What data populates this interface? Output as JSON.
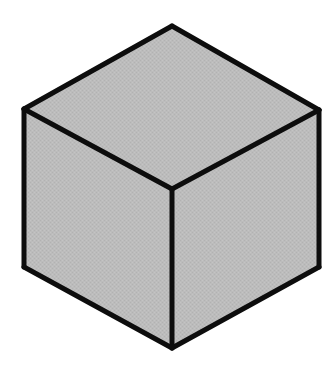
{
  "figure": {
    "name": "isometric-cube",
    "canvas": {
      "width": 336,
      "height": 365,
      "background_color": "#ffffff"
    },
    "style": {
      "edge_color": "#0d0d0d",
      "edge_width": 5,
      "face_fill": "#b9b9b9",
      "face_fill_alt": "#bdbdbd",
      "texture": "fine dithered halftone grain"
    },
    "vertices": {
      "top": [
        172,
        26
      ],
      "upper_left": [
        24,
        109
      ],
      "upper_right": [
        319,
        110
      ],
      "center": [
        172,
        189
      ],
      "lower_left": [
        24,
        267
      ],
      "lower_right": [
        319,
        267
      ],
      "bottom": [
        172,
        348
      ]
    },
    "faces": [
      {
        "id": "top-face",
        "label": "Top face",
        "fill": "#bdbdbd",
        "points": "172,26 24,109 172,189 319,110"
      },
      {
        "id": "left-face",
        "label": "Left face",
        "fill": "#b9b9b9",
        "points": "24,109 24,267 172,348 172,189"
      },
      {
        "id": "right-face",
        "label": "Right face",
        "fill": "#b9b9b9",
        "points": "172,189 172,348 319,267 319,110"
      }
    ],
    "edges": [
      {
        "id": "edge-top-left",
        "label": "Top-left silhouette edge",
        "path": "M 172,26 L 24,109"
      },
      {
        "id": "edge-top-right",
        "label": "Top-right silhouette edge",
        "path": "M 172,26 L 319,110"
      },
      {
        "id": "edge-left-vertical",
        "label": "Left vertical silhouette edge",
        "path": "M 24,109 L 24,267"
      },
      {
        "id": "edge-right-vertical",
        "label": "Right vertical silhouette edge",
        "path": "M 319,110 L 319,267"
      },
      {
        "id": "edge-bottom-left",
        "label": "Bottom-left silhouette edge",
        "path": "M 24,267 L 172,348"
      },
      {
        "id": "edge-bottom-right",
        "label": "Bottom-right silhouette edge",
        "path": "M 319,267 L 172,348"
      },
      {
        "id": "edge-inner-left",
        "label": "Inner edge to upper-left",
        "path": "M 172,189 L 24,109"
      },
      {
        "id": "edge-inner-right",
        "label": "Inner edge to upper-right",
        "path": "M 172,189 L 319,110"
      },
      {
        "id": "edge-inner-vertical",
        "label": "Inner vertical edge",
        "path": "M 172,189 L 172,348"
      }
    ]
  }
}
